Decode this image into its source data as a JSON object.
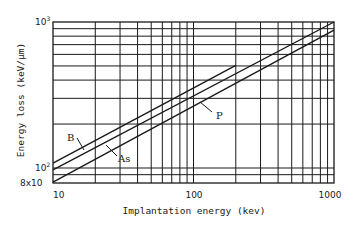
{
  "chart_data": {
    "type": "line",
    "title": "",
    "xlabel": "Implantation energy (kev)",
    "ylabel": "Energy loss (keV/μm)",
    "xscale": "log",
    "yscale": "log",
    "xlim": [
      10,
      1000
    ],
    "ylim": [
      80,
      1000
    ],
    "x_ticks": [
      "10",
      "100",
      "1000"
    ],
    "y_ticks": [
      "8x10",
      "10²",
      "10³"
    ],
    "grid": true,
    "legend": "inline labels",
    "series": [
      {
        "name": "B",
        "x": [
          10,
          200
        ],
        "values": [
          108,
          505
        ]
      },
      {
        "name": "As",
        "x": [
          10,
          1000
        ],
        "values": [
          97,
          1000
        ]
      },
      {
        "name": "P",
        "x": [
          10,
          1000
        ],
        "values": [
          80,
          880
        ]
      }
    ]
  },
  "labels": {
    "xlabel": "Implantation energy (kev)",
    "ylabel": "Energy loss (keV/μm)",
    "x_tick_10": "10",
    "x_tick_100": "100",
    "x_tick_1000": "1000",
    "y_tick_80": "8x10",
    "y_tick_100_base": "10",
    "y_tick_100_exp": "2",
    "y_tick_1000_base": "10",
    "y_tick_1000_exp": "3",
    "series_b": "B",
    "series_as": "As",
    "series_p": "P"
  }
}
